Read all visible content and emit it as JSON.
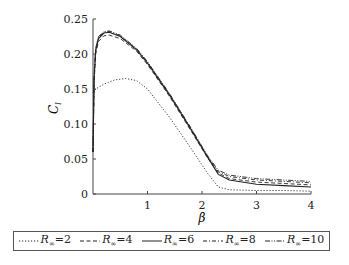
{
  "chart_data": {
    "type": "line",
    "title": "",
    "xlabel": "β",
    "ylabel": "C_l",
    "xlim": [
      0,
      4
    ],
    "ylim": [
      0,
      0.25
    ],
    "xticks": [
      "1",
      "2",
      "3",
      "4"
    ],
    "yticks": [
      "0",
      "0.05",
      "0.10",
      "0.15",
      "0.20",
      "0.25"
    ],
    "grid": false,
    "legend_position": "bottom (boxed, horizontal)",
    "series": [
      {
        "name": "R∞=2",
        "style": "dotted",
        "x": [
          0,
          0.05,
          0.2,
          0.4,
          0.6,
          0.8,
          1.0,
          1.4,
          1.8,
          2.1,
          2.3,
          2.5,
          3.0,
          3.5,
          4.0
        ],
        "y": [
          0.145,
          0.15,
          0.157,
          0.163,
          0.165,
          0.162,
          0.15,
          0.11,
          0.065,
          0.03,
          0.01,
          0.006,
          0.005,
          0.005,
          0.004
        ]
      },
      {
        "name": "R∞=4",
        "style": "dashed",
        "x": [
          0,
          0.02,
          0.05,
          0.1,
          0.2,
          0.3,
          0.5,
          0.8,
          1.0,
          1.4,
          1.8,
          2.1,
          2.3,
          2.5,
          3.0,
          3.5,
          4.0
        ],
        "y": [
          0.06,
          0.16,
          0.2,
          0.218,
          0.226,
          0.227,
          0.222,
          0.204,
          0.185,
          0.14,
          0.09,
          0.052,
          0.03,
          0.022,
          0.017,
          0.015,
          0.013
        ]
      },
      {
        "name": "R∞=6",
        "style": "solid",
        "x": [
          0,
          0.02,
          0.05,
          0.1,
          0.2,
          0.3,
          0.5,
          0.8,
          1.0,
          1.4,
          1.8,
          2.1,
          2.3,
          2.5,
          3.0,
          3.5,
          4.0
        ],
        "y": [
          0.06,
          0.165,
          0.205,
          0.222,
          0.23,
          0.231,
          0.225,
          0.206,
          0.187,
          0.142,
          0.092,
          0.053,
          0.028,
          0.02,
          0.014,
          0.012,
          0.01
        ]
      },
      {
        "name": "R∞=8",
        "style": "dash-dot",
        "x": [
          0,
          0.02,
          0.05,
          0.1,
          0.2,
          0.3,
          0.5,
          0.8,
          1.0,
          1.4,
          1.8,
          2.1,
          2.3,
          2.5,
          3.0,
          3.5,
          4.0
        ],
        "y": [
          0.06,
          0.168,
          0.207,
          0.224,
          0.231,
          0.232,
          0.226,
          0.207,
          0.188,
          0.143,
          0.093,
          0.054,
          0.032,
          0.025,
          0.02,
          0.018,
          0.016
        ]
      },
      {
        "name": "R∞=10",
        "style": "dash-dot-dot",
        "x": [
          0,
          0.02,
          0.05,
          0.1,
          0.2,
          0.3,
          0.5,
          0.8,
          1.0,
          1.4,
          1.8,
          2.1,
          2.3,
          2.5,
          3.0,
          3.5,
          4.0
        ],
        "y": [
          0.06,
          0.17,
          0.208,
          0.225,
          0.232,
          0.233,
          0.227,
          0.208,
          0.189,
          0.144,
          0.094,
          0.055,
          0.034,
          0.027,
          0.022,
          0.02,
          0.018
        ]
      }
    ]
  },
  "axes": {
    "x_label": "β",
    "y_label_main": "C",
    "y_label_sub": "l"
  },
  "legend": [
    {
      "prefix": "R",
      "sub": "∞",
      "value": "=2"
    },
    {
      "prefix": "R",
      "sub": "∞",
      "value": "=4"
    },
    {
      "prefix": "R",
      "sub": "∞",
      "value": "=6"
    },
    {
      "prefix": "R",
      "sub": "∞",
      "value": "=8"
    },
    {
      "prefix": "R",
      "sub": "∞",
      "value": "=10"
    }
  ]
}
